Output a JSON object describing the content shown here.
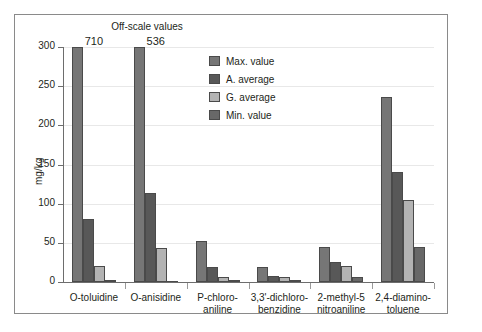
{
  "chart_data": {
    "type": "bar",
    "title": "",
    "annotation_title": "Off-scale values",
    "xlabel": "",
    "ylabel": "mg/kg",
    "ylim": [
      0,
      300
    ],
    "yticks": [
      0,
      50,
      100,
      150,
      200,
      250,
      300
    ],
    "ytick_labels": [
      "0",
      "50",
      "100",
      "150",
      "200",
      "250",
      "300"
    ],
    "grid": true,
    "legend_position": "upper-center-right",
    "categories": [
      "O-toluidine",
      "O-anisidine",
      "P-chloro-\naniline",
      "3,3'-dichloro-\nbenzidine",
      "2-methyl-5\nnitroaniline",
      "2,4-diamino-\ntoluene"
    ],
    "category_lines": [
      [
        "O-toluidine"
      ],
      [
        "O-anisidine"
      ],
      [
        "P-chloro-",
        "aniline"
      ],
      [
        "3,3'-dichloro-",
        "benzidine"
      ],
      [
        "2-methyl-5",
        "nitroaniline"
      ],
      [
        "2,4-diamino-",
        "toluene"
      ]
    ],
    "series": [
      {
        "name": "Max. value",
        "color": "#767676",
        "values": [
          710,
          536,
          52,
          19,
          45,
          236
        ],
        "clipped": [
          true,
          true,
          false,
          false,
          false,
          false
        ]
      },
      {
        "name": "A. average",
        "color": "#585858",
        "values": [
          80,
          113,
          19,
          8,
          25,
          141
        ],
        "clipped": [
          false,
          false,
          false,
          false,
          false,
          false
        ]
      },
      {
        "name": "G. average",
        "color": "#b3b3b3",
        "values": [
          21,
          44,
          7,
          7,
          20,
          105
        ],
        "clipped": [
          false,
          false,
          false,
          false,
          false,
          false
        ]
      },
      {
        "name": "Min. value",
        "color": "#686868",
        "values": [
          2,
          1,
          2,
          3,
          7,
          45
        ],
        "clipped": [
          false,
          false,
          false,
          false,
          false,
          false
        ]
      }
    ],
    "offscale_annotations": [
      {
        "category": "O-toluidine",
        "value": "710"
      },
      {
        "category": "O-anisidine",
        "value": "536"
      }
    ]
  },
  "legend": {
    "items": [
      {
        "label": "Max. value",
        "color": "#767676"
      },
      {
        "label": "A. average",
        "color": "#585858"
      },
      {
        "label": "G. average",
        "color": "#b3b3b3"
      },
      {
        "label": "Min. value",
        "color": "#686868"
      }
    ]
  }
}
